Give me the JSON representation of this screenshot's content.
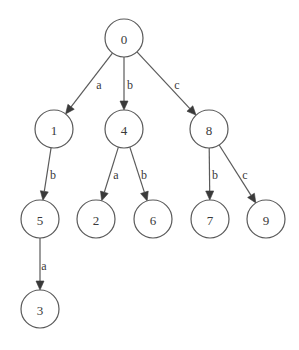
{
  "diagram": {
    "type": "trie",
    "colors": {
      "background": "#ffffff",
      "stroke": "#5a5a5a",
      "text": "#3a3a3a"
    },
    "node_radius": 19,
    "nodes": [
      {
        "id": "0",
        "label": "0",
        "x": 124,
        "y": 38
      },
      {
        "id": "1",
        "label": "1",
        "x": 54,
        "y": 129
      },
      {
        "id": "4",
        "label": "4",
        "x": 124,
        "y": 129
      },
      {
        "id": "8",
        "label": "8",
        "x": 209,
        "y": 129
      },
      {
        "id": "5",
        "label": "5",
        "x": 40,
        "y": 219
      },
      {
        "id": "2",
        "label": "2",
        "x": 96,
        "y": 219
      },
      {
        "id": "6",
        "label": "6",
        "x": 153,
        "y": 219
      },
      {
        "id": "7",
        "label": "7",
        "x": 210,
        "y": 219
      },
      {
        "id": "9",
        "label": "9",
        "x": 266,
        "y": 219
      },
      {
        "id": "3",
        "label": "3",
        "x": 40,
        "y": 309
      }
    ],
    "edges": [
      {
        "from": "0",
        "to": "1",
        "label": "a",
        "lx": 99,
        "ly": 85
      },
      {
        "from": "0",
        "to": "4",
        "label": "b",
        "lx": 130,
        "ly": 85
      },
      {
        "from": "0",
        "to": "8",
        "label": "c",
        "lx": 177,
        "ly": 85
      },
      {
        "from": "1",
        "to": "5",
        "label": "b",
        "lx": 53,
        "ly": 175
      },
      {
        "from": "4",
        "to": "2",
        "label": "a",
        "lx": 116,
        "ly": 175
      },
      {
        "from": "4",
        "to": "6",
        "label": "b",
        "lx": 144,
        "ly": 175
      },
      {
        "from": "8",
        "to": "7",
        "label": "b",
        "lx": 215,
        "ly": 175
      },
      {
        "from": "8",
        "to": "9",
        "label": "c",
        "lx": 245,
        "ly": 175
      },
      {
        "from": "5",
        "to": "3",
        "label": "a",
        "lx": 44,
        "ly": 266
      }
    ]
  }
}
